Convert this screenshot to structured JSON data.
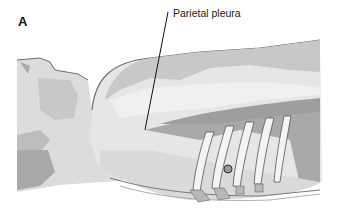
{
  "figure": {
    "panel_letter": "A",
    "labels": [
      {
        "text": "Parietal pleura",
        "target": "parietal-pleura"
      }
    ],
    "colors": {
      "background": "#ffffff",
      "outline": "#6e6e6e",
      "light_tissue": "#e6e6e6",
      "mid_tissue": "#c8c8c8",
      "dark_tissue": "#a9a9a9",
      "rib": "#f2f2f2",
      "leader_line": "#111111",
      "marker": "#9a9a9a"
    }
  }
}
